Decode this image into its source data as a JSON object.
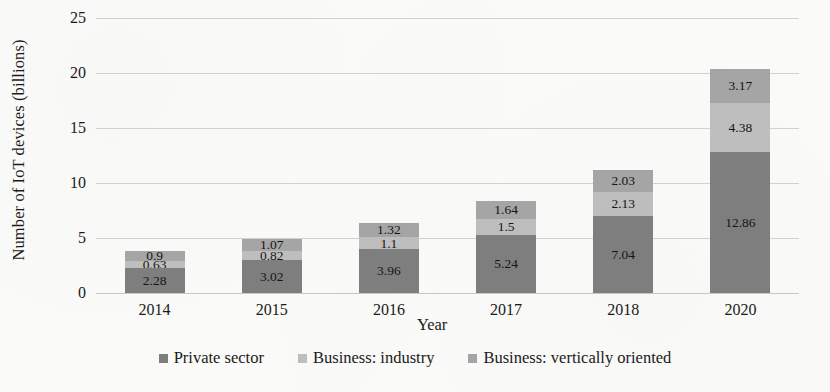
{
  "chart_data": {
    "type": "bar",
    "subtype": "stacked-bar",
    "title": "",
    "xlabel": "Year",
    "ylabel": "Number of IoT devices (billions)",
    "categories": [
      "2014",
      "2015",
      "2016",
      "2017",
      "2018",
      "2020"
    ],
    "ylim": [
      0,
      25
    ],
    "yticks": [
      0,
      5,
      10,
      15,
      20,
      25
    ],
    "ytick_labels": [
      "0",
      "5",
      "10",
      "15",
      "20",
      "25"
    ],
    "grid": "horizontal",
    "legend_position": "bottom",
    "series": [
      {
        "name": "Private sector",
        "color": "#7f7f7f",
        "values": [
          2.28,
          3.02,
          3.96,
          5.24,
          7.04,
          12.86
        ],
        "labels": [
          "2.28",
          "3.02",
          "3.96",
          "5.24",
          "7.04",
          "12.86"
        ]
      },
      {
        "name": "Business: industry",
        "color": "#bfbfbf",
        "values": [
          0.63,
          0.82,
          1.1,
          1.5,
          2.13,
          4.38
        ],
        "labels": [
          "0.63",
          "0.82",
          "1.1",
          "1.5",
          "2.13",
          "4.38"
        ]
      },
      {
        "name": "Business: vertically oriented",
        "color": "#a6a6a6",
        "values": [
          0.9,
          1.07,
          1.32,
          1.64,
          2.03,
          3.17
        ],
        "labels": [
          "0.9",
          "1.07",
          "1.32",
          "1.64",
          "2.03",
          "3.17"
        ]
      }
    ],
    "totals": [
      3.81,
      4.91,
      6.38,
      8.38,
      11.2,
      20.41
    ]
  },
  "axes": {
    "y_title": "Number of IoT devices (billions)",
    "x_title": "Year"
  },
  "legend": {
    "items": [
      {
        "label": "Private sector",
        "color": "#7f7f7f",
        "swatch_icon": "square-swatch-icon"
      },
      {
        "label": "Business: industry",
        "color": "#bfbfbf",
        "swatch_icon": "square-swatch-icon"
      },
      {
        "label": "Business: vertically oriented",
        "color": "#a6a6a6",
        "swatch_icon": "square-swatch-icon"
      }
    ]
  }
}
